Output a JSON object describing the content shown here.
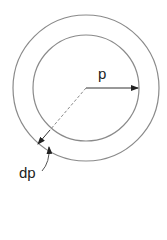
{
  "diagram": {
    "labels": {
      "radius": "p",
      "thickness": "dp"
    },
    "geometry": {
      "center": [
        86,
        88
      ],
      "inner_radius": 53,
      "outer_radius": 73
    },
    "colors": {
      "stroke": "#8a8a8a",
      "arrow": "#222222",
      "text": "#222222"
    }
  }
}
